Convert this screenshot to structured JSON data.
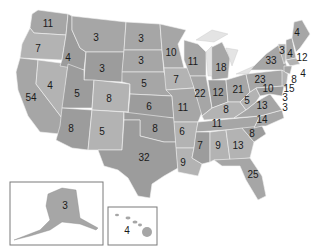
{
  "map": {
    "title": "",
    "type": "US electoral votes by state",
    "fill_color": "#a6a6a6",
    "border_color": "#f2f2f2",
    "label_color": "#1a1a1a"
  },
  "states": [
    {
      "id": "WA",
      "value": "11",
      "x": 48,
      "y": 24
    },
    {
      "id": "OR",
      "value": "7",
      "x": 38,
      "y": 49
    },
    {
      "id": "CA",
      "value": "54",
      "x": 31,
      "y": 98
    },
    {
      "id": "NV",
      "value": "4",
      "x": 50,
      "y": 86
    },
    {
      "id": "ID",
      "value": "4",
      "x": 68,
      "y": 58
    },
    {
      "id": "MT",
      "value": "3",
      "x": 96,
      "y": 38
    },
    {
      "id": "WY",
      "value": "3",
      "x": 102,
      "y": 69
    },
    {
      "id": "UT",
      "value": "5",
      "x": 77,
      "y": 94
    },
    {
      "id": "CO",
      "value": "8",
      "x": 109,
      "y": 99
    },
    {
      "id": "AZ",
      "value": "8",
      "x": 71,
      "y": 129
    },
    {
      "id": "NM",
      "value": "5",
      "x": 102,
      "y": 132
    },
    {
      "id": "ND",
      "value": "3",
      "x": 141,
      "y": 39
    },
    {
      "id": "SD",
      "value": "3",
      "x": 141,
      "y": 61
    },
    {
      "id": "NE",
      "value": "5",
      "x": 144,
      "y": 84
    },
    {
      "id": "KS",
      "value": "6",
      "x": 149,
      "y": 107
    },
    {
      "id": "OK",
      "value": "8",
      "x": 155,
      "y": 129
    },
    {
      "id": "TX",
      "value": "32",
      "x": 144,
      "y": 158
    },
    {
      "id": "MN",
      "value": "10",
      "x": 171,
      "y": 53
    },
    {
      "id": "IA",
      "value": "7",
      "x": 176,
      "y": 80
    },
    {
      "id": "MO",
      "value": "11",
      "x": 183,
      "y": 108
    },
    {
      "id": "AR",
      "value": "6",
      "x": 182,
      "y": 132
    },
    {
      "id": "LA",
      "value": "9",
      "x": 183,
      "y": 163
    },
    {
      "id": "WI",
      "value": "11",
      "x": 193,
      "y": 62
    },
    {
      "id": "IL",
      "value": "22",
      "x": 200,
      "y": 94
    },
    {
      "id": "MI",
      "value": "18",
      "x": 221,
      "y": 68
    },
    {
      "id": "IN",
      "value": "12",
      "x": 218,
      "y": 93
    },
    {
      "id": "OH",
      "value": "21",
      "x": 238,
      "y": 90
    },
    {
      "id": "KY",
      "value": "8",
      "x": 226,
      "y": 110
    },
    {
      "id": "TN",
      "value": "11",
      "x": 217,
      "y": 124
    },
    {
      "id": "MS",
      "value": "7",
      "x": 200,
      "y": 146
    },
    {
      "id": "AL",
      "value": "9",
      "x": 218,
      "y": 146
    },
    {
      "id": "GA",
      "value": "13",
      "x": 238,
      "y": 146
    },
    {
      "id": "FL",
      "value": "25",
      "x": 253,
      "y": 175
    },
    {
      "id": "SC",
      "value": "8",
      "x": 252,
      "y": 134
    },
    {
      "id": "NC",
      "value": "14",
      "x": 262,
      "y": 120
    },
    {
      "id": "VA",
      "value": "13",
      "x": 262,
      "y": 106
    },
    {
      "id": "WV",
      "value": "5",
      "x": 247,
      "y": 101
    },
    {
      "id": "PA",
      "value": "23",
      "x": 260,
      "y": 80
    },
    {
      "id": "NY",
      "value": "33",
      "x": 271,
      "y": 61
    },
    {
      "id": "VT",
      "value": "3",
      "x": 282,
      "y": 51
    },
    {
      "id": "NH",
      "value": "4",
      "x": 290,
      "y": 54
    },
    {
      "id": "ME",
      "value": "4",
      "x": 297,
      "y": 33
    },
    {
      "id": "MA",
      "value": "12",
      "x": 302,
      "y": 58
    },
    {
      "id": "RI",
      "value": "4",
      "x": 303,
      "y": 74
    },
    {
      "id": "CT",
      "value": "8",
      "x": 294,
      "y": 80
    },
    {
      "id": "NJ",
      "value": "15",
      "x": 289,
      "y": 89
    },
    {
      "id": "MD",
      "value": "10",
      "x": 268,
      "y": 89
    },
    {
      "id": "DE",
      "value": "3",
      "x": 285,
      "y": 98
    },
    {
      "id": "DC",
      "value": "3",
      "x": 285,
      "y": 108
    },
    {
      "id": "AK",
      "value": "3",
      "x": 65,
      "y": 206
    },
    {
      "id": "HI",
      "value": "4",
      "x": 127,
      "y": 231
    }
  ]
}
